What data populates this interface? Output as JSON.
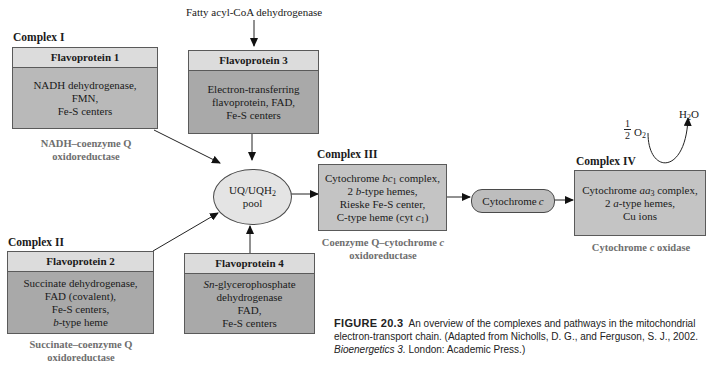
{
  "top_label": "Fatty acyl-CoA dehydrogenase",
  "complex1": {
    "label": "Complex I",
    "header": "Flavoprotein 1",
    "lines": [
      "NADH dehydrogenase,",
      "FMN,",
      "Fe-S centers"
    ],
    "name_line1": "NADH–coenzyme Q",
    "name_line2": "oxidoreductase"
  },
  "flavoprotein3": {
    "header": "Flavoprotein 3",
    "lines": [
      "Electron-transferring",
      "flavoprotein, FAD,",
      "Fe-S centers"
    ]
  },
  "complex2": {
    "label": "Complex II",
    "header": "Flavoprotein 2",
    "lines": [
      "Succinate dehydrogenase,",
      "FAD (covalent),",
      "Fe-S centers,",
      "-type heme"
    ],
    "heme_prefix": "b",
    "name_line1": "Succinate–coenzyme Q",
    "name_line2": "oxidoreductase"
  },
  "flavoprotein4": {
    "header": "Flavoprotein 4",
    "line1_prefix": "Sn",
    "line1_rest": "-glycerophosphate",
    "lines": [
      "dehydrogenase",
      "FAD,",
      "Fe-S centers"
    ]
  },
  "pool": {
    "line1_main": "UQ/UQH",
    "line1_sub": "2",
    "line2": "pool"
  },
  "complex3": {
    "label": "Complex III",
    "line1_a": "Cytochrome ",
    "line1_italic": "bc",
    "line1_sub": "1",
    "line1_b": " complex,",
    "line2_a": "2 ",
    "line2_italic": "b",
    "line2_b": "-type hemes,",
    "line3": "Rieske Fe-S center,",
    "line4_a": "C-type heme (cyt ",
    "line4_italic": "c",
    "line4_sub": "1",
    "line4_b": ")",
    "name_line1_a": "Coenzyme Q–cytochrome ",
    "name_line1_italic": "c",
    "name_line2": "oxidoreductase"
  },
  "cytochrome_c": {
    "text": "Cytochrome ",
    "italic": "c"
  },
  "complex4": {
    "label": "Complex IV",
    "line1_a": "Cytochrome ",
    "line1_italic": "aa",
    "line1_sub": "3",
    "line1_b": " complex,",
    "line2_a": "2 ",
    "line2_italic": "a",
    "line2_b": "-type hemes,",
    "line3": "Cu ions",
    "name_a": "Cytochrome ",
    "name_italic": "c",
    "name_b": " oxidase"
  },
  "oxygen": {
    "frac_num": "1",
    "frac_den": "2",
    "species": "O",
    "sub": "2",
    "product_a": "H",
    "product_sub": "2",
    "product_b": "O"
  },
  "caption": {
    "figure_number": "FIGURE 20.3",
    "text_a": "An overview of the complexes and pathways in the mitochondrial electron-transport chain. (Adapted from Nicholls, D. G., and Ferguson, S. J., 2002. ",
    "book": "Bioenergetics 3.",
    "text_b": " London: Academic Press.)"
  },
  "colors": {
    "box_fill": "#b9b9b9",
    "box_header": "#dcdcdc",
    "name_gray": "#6e6e6e",
    "pool_fill": "#e4e4e4"
  }
}
